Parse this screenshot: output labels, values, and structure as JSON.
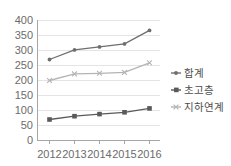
{
  "chart_data": {
    "type": "line",
    "title": "",
    "xlabel": "",
    "ylabel": "",
    "categories": [
      "2012",
      "2013",
      "2014",
      "2015",
      "2016"
    ],
    "series": [
      {
        "name": "합계",
        "color": "#6e6e6e",
        "marker": "dot",
        "values": [
          270,
          302,
          312,
          322,
          367
        ]
      },
      {
        "name": "초고층",
        "color": "#5a5a5a",
        "marker": "square",
        "values": [
          70,
          81,
          88,
          94,
          107
        ]
      },
      {
        "name": "지하연계",
        "color": "#b4b4b4",
        "marker": "cross",
        "values": [
          200,
          222,
          224,
          227,
          259
        ]
      }
    ],
    "ylim": [
      0,
      400
    ],
    "ytick_values": [
      "0",
      "50",
      "100",
      "150",
      "200",
      "250",
      "300",
      "350",
      "400"
    ],
    "ytick_step": 50,
    "grid": true,
    "legend_position": "right"
  },
  "axis": {
    "y_labels": [
      "400",
      "350",
      "300",
      "250",
      "200",
      "150",
      "100",
      "50",
      "0"
    ],
    "x_labels": [
      "2012",
      "2013",
      "2014",
      "2015",
      "2016"
    ]
  },
  "legend": {
    "entries": [
      {
        "label": "합계",
        "color": "#6e6e6e"
      },
      {
        "label": "초고층",
        "color": "#5a5a5a"
      },
      {
        "label": "지하연계",
        "color": "#b4b4b4"
      }
    ]
  }
}
